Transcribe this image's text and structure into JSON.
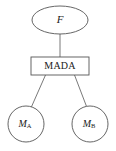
{
  "diagram": {
    "type": "hierarchy-tree",
    "background_color": "#ffffff",
    "stroke_color": "#555555",
    "text_color": "#1a1a1a",
    "nodes": {
      "root": {
        "shape": "ellipse",
        "label": "F",
        "style": "italic"
      },
      "middle": {
        "shape": "rectangle",
        "label": "MADA",
        "style": "roman"
      },
      "leaf_left": {
        "shape": "circle",
        "label": "M",
        "subscript": "A",
        "style": "italic"
      },
      "leaf_right": {
        "shape": "circle",
        "label": "M",
        "subscript": "B",
        "style": "italic"
      }
    },
    "edges": [
      {
        "from": "root",
        "to": "middle",
        "kind": "vertical"
      },
      {
        "from": "middle",
        "to": "leaf_left",
        "kind": "diagonal"
      },
      {
        "from": "middle",
        "to": "leaf_right",
        "kind": "diagonal"
      }
    ]
  }
}
